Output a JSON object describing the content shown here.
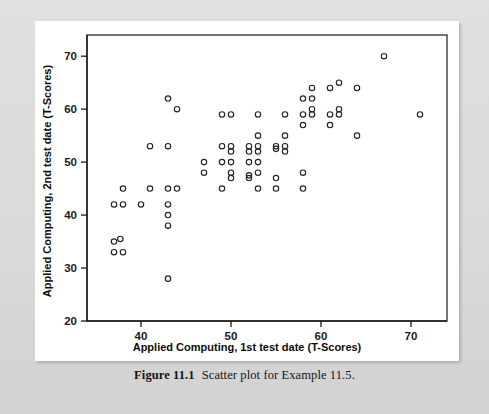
{
  "figure": {
    "caption_label": "Figure 11.1",
    "caption_text": "Scatter plot for Example 11.5.",
    "background_color": "#dcdcdc",
    "card_color": "#ffffff",
    "marker_color": "#242424",
    "axis_color": "#1b1b1b"
  },
  "chart_data": {
    "type": "scatter",
    "title": "",
    "xlabel": "Applied Computing, 1st test date (T-Scores)",
    "ylabel": "Applied Computing, 2nd test date (T-Scores)",
    "xlim": [
      34,
      74
    ],
    "ylim": [
      20,
      74
    ],
    "xticks": [
      40,
      50,
      60,
      70
    ],
    "xtick_labels": [
      "40",
      "50",
      "60",
      "70"
    ],
    "yticks": [
      20,
      30,
      40,
      50,
      60,
      70
    ],
    "ytick_labels": [
      "20",
      "30",
      "40",
      "50",
      "60",
      "70"
    ],
    "grid": false,
    "legend": false,
    "marker": "open-circle",
    "series": [
      {
        "name": "Applied Computing test scores",
        "points": [
          [
            37,
            42
          ],
          [
            38,
            42
          ],
          [
            38,
            45
          ],
          [
            37,
            35
          ],
          [
            37.7,
            35.5
          ],
          [
            37,
            33
          ],
          [
            38,
            33
          ],
          [
            40,
            42
          ],
          [
            41,
            45
          ],
          [
            41,
            53
          ],
          [
            43,
            62
          ],
          [
            43,
            53
          ],
          [
            43,
            45
          ],
          [
            43,
            42
          ],
          [
            43,
            40
          ],
          [
            43,
            38
          ],
          [
            43,
            28
          ],
          [
            44,
            45
          ],
          [
            44,
            60
          ],
          [
            47,
            50
          ],
          [
            47,
            48
          ],
          [
            49,
            59
          ],
          [
            49,
            53
          ],
          [
            49,
            50
          ],
          [
            49,
            45
          ],
          [
            50,
            59
          ],
          [
            50,
            53
          ],
          [
            50,
            52
          ],
          [
            50,
            50
          ],
          [
            50,
            48
          ],
          [
            50,
            47
          ],
          [
            52,
            53
          ],
          [
            52,
            52
          ],
          [
            52,
            50
          ],
          [
            52,
            47.5
          ],
          [
            52,
            47
          ],
          [
            53,
            59
          ],
          [
            53,
            55
          ],
          [
            53,
            53
          ],
          [
            53,
            52
          ],
          [
            53,
            50
          ],
          [
            53,
            48
          ],
          [
            53,
            45
          ],
          [
            55,
            53
          ],
          [
            55,
            52.5
          ],
          [
            55,
            47
          ],
          [
            55,
            45
          ],
          [
            56,
            59
          ],
          [
            56,
            55
          ],
          [
            56,
            53
          ],
          [
            56,
            52
          ],
          [
            58,
            62
          ],
          [
            58,
            59
          ],
          [
            58,
            57
          ],
          [
            58,
            48
          ],
          [
            58,
            45
          ],
          [
            59,
            64
          ],
          [
            59,
            62
          ],
          [
            59,
            60
          ],
          [
            59,
            59
          ],
          [
            61,
            64
          ],
          [
            61,
            59
          ],
          [
            61,
            57
          ],
          [
            62,
            65
          ],
          [
            62,
            60
          ],
          [
            62,
            59
          ],
          [
            64,
            64
          ],
          [
            64,
            55
          ],
          [
            67,
            70
          ],
          [
            71,
            59
          ]
        ]
      }
    ]
  }
}
